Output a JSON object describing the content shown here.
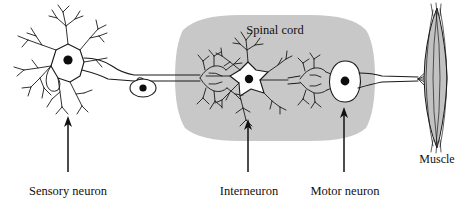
{
  "figure": {
    "background_color": "#ffffff",
    "ink_color": "#1a1a1a",
    "spinal_cord_fill": "#c8c8c8",
    "cell_body_fill": "#ffffff",
    "muscle_fill": "#c2c2c2"
  },
  "labels": {
    "spinal_cord": "Spinal cord",
    "muscle": "Muscle",
    "sensory_neuron": "Sensory neuron",
    "interneuron": "Interneuron",
    "motor_neuron": "Motor neuron"
  },
  "structures": [
    {
      "name": "sensory-neuron",
      "label": "Sensory neuron",
      "type": "multipolar-neuron",
      "cell_body_center": [
        67,
        63
      ],
      "has_arrow_callout": true,
      "arrow_x": 68,
      "arrow_from_y": 172,
      "arrow_to_y": 119
    },
    {
      "name": "dorsal-root-ganglion",
      "label": "",
      "type": "ganglion-cell-body",
      "cell_body_center": [
        143,
        88
      ],
      "has_arrow_callout": false
    },
    {
      "name": "interneuron",
      "label": "Interneuron",
      "type": "stellate-neuron",
      "cell_body_center": [
        248,
        80
      ],
      "has_arrow_callout": true,
      "arrow_x": 248,
      "arrow_from_y": 172,
      "arrow_to_y": 122
    },
    {
      "name": "motor-neuron",
      "label": "Motor neuron",
      "type": "oval-soma-neuron",
      "cell_body_center": [
        344,
        82
      ],
      "has_arrow_callout": true,
      "arrow_x": 344,
      "arrow_from_y": 172,
      "arrow_to_y": 110
    },
    {
      "name": "muscle",
      "label": "Muscle",
      "type": "muscle-fiber-spindle",
      "center": [
        432,
        78
      ],
      "has_arrow_callout": false
    }
  ],
  "spinal_cord_region": {
    "shape": "rounded-ellipse",
    "center_x": 275,
    "center_y": 78,
    "radius_x": 100,
    "radius_y": 62
  },
  "label_positions": {
    "spinal_cord": [
      275,
      30
    ],
    "muscle": [
      437,
      159
    ],
    "sensory_neuron": [
      68,
      191
    ],
    "interneuron": [
      249,
      191
    ],
    "motor_neuron": [
      345,
      191
    ]
  }
}
